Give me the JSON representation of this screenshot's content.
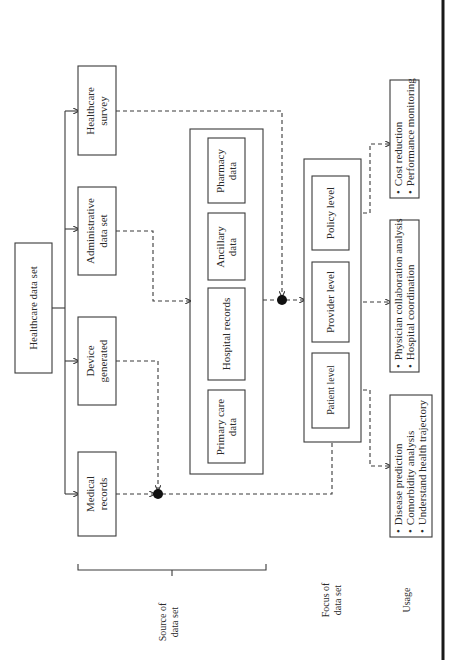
{
  "diagram": {
    "orientation": "rotated-90-ccw",
    "root": {
      "label": "Healthcare data set"
    },
    "sources": [
      {
        "id": "healthcare-survey",
        "lines": [
          "Healthcare",
          "survey"
        ]
      },
      {
        "id": "administrative-data-set",
        "lines": [
          "Administrative",
          "data set"
        ]
      },
      {
        "id": "device-generated",
        "lines": [
          "Device",
          "generated"
        ]
      },
      {
        "id": "medical-records",
        "lines": [
          "Medical",
          "records"
        ]
      }
    ],
    "data_types": [
      {
        "id": "pharmacy-data",
        "lines": [
          "Pharmacy",
          "data"
        ]
      },
      {
        "id": "ancillary-data",
        "lines": [
          "Ancillary",
          "data"
        ]
      },
      {
        "id": "hospital-records",
        "lines": [
          "Hospital records"
        ]
      },
      {
        "id": "primary-care-data",
        "lines": [
          "Primary care",
          "data"
        ]
      }
    ],
    "focus_levels": [
      {
        "id": "policy-level",
        "label": "Policy level"
      },
      {
        "id": "provider-level",
        "label": "Provider level"
      },
      {
        "id": "patient-level",
        "label": "Patient level"
      }
    ],
    "usages": [
      {
        "id": "policy-usage",
        "items": [
          "Cost reduction",
          "Performance monitoring"
        ]
      },
      {
        "id": "provider-usage",
        "items": [
          "Physician collaboration analysis",
          "Hospital coordination"
        ]
      },
      {
        "id": "patient-usage",
        "items": [
          "Disease prediction",
          "Comorbidity analysis",
          "Understand health trajectory"
        ]
      }
    ],
    "row_labels": {
      "source": [
        "Source of",
        "data set"
      ],
      "focus": [
        "Focus of",
        "data set"
      ],
      "usage": "Usage"
    },
    "bullet": "•"
  }
}
